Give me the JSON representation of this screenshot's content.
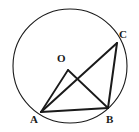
{
  "figure": {
    "background_color": "#ffffff",
    "stroke_color": "#1a1a1a",
    "canvas": {
      "width": 139,
      "height": 132
    },
    "circle": {
      "name": "circumscribed-circle",
      "center_x": 70,
      "center_y": 66,
      "radius": 57,
      "stroke_width": 1.1
    },
    "points": {
      "O": {
        "label": "O",
        "x": 68,
        "y": 70,
        "role": "center"
      },
      "A": {
        "label": "A",
        "x": 41,
        "y": 112,
        "role": "on-circle"
      },
      "B": {
        "label": "B",
        "x": 108,
        "y": 108,
        "role": "on-circle"
      },
      "C": {
        "label": "C",
        "x": 117,
        "y": 43,
        "role": "on-circle"
      }
    },
    "segments": [
      {
        "name": "segment-OA",
        "from": "O",
        "to": "A",
        "x1": 68,
        "y1": 70,
        "x2": 41,
        "y2": 112,
        "stroke_width": 1.8
      },
      {
        "name": "segment-OB",
        "from": "O",
        "to": "B",
        "x1": 68,
        "y1": 70,
        "x2": 108,
        "y2": 108,
        "stroke_width": 1.8
      },
      {
        "name": "segment-AB",
        "from": "A",
        "to": "B",
        "x1": 41,
        "y1": 112,
        "x2": 108,
        "y2": 108,
        "stroke_width": 2.0
      },
      {
        "name": "segment-AC",
        "from": "A",
        "to": "C",
        "x1": 41,
        "y1": 112,
        "x2": 117,
        "y2": 43,
        "stroke_width": 2.0
      },
      {
        "name": "segment-CB",
        "from": "C",
        "to": "B",
        "x1": 117,
        "y1": 43,
        "x2": 108,
        "y2": 108,
        "stroke_width": 2.0
      }
    ],
    "labels": {
      "O": "O",
      "A": "A",
      "B": "B",
      "C": "C"
    }
  }
}
